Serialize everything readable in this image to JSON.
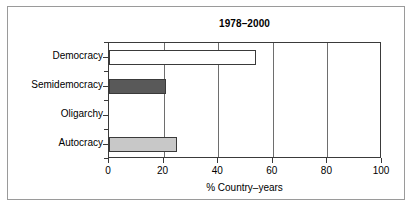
{
  "chart_data": {
    "type": "bar",
    "orientation": "horizontal",
    "title": "1978–2000",
    "xlabel": "% Country–years",
    "ylabel": "",
    "xlim": [
      0,
      100
    ],
    "xticks": [
      0,
      20,
      40,
      60,
      80,
      100
    ],
    "xtick_labels": [
      "0",
      "20",
      "40",
      "60",
      "80",
      "100"
    ],
    "grid": "vertical",
    "legend": "none",
    "categories": [
      "Democracy",
      "Semidemocracy",
      "Oligarchy",
      "Autocracy"
    ],
    "values": [
      54,
      21,
      0,
      25
    ],
    "bar_colors": [
      "#ffffff",
      "#595959",
      "#ffffff",
      "#c8c8c8"
    ],
    "bar_edge_color": "#3a3a3a",
    "bars": [
      {
        "category": "Democracy",
        "value": 54,
        "fill": "#ffffff"
      },
      {
        "category": "Semidemocracy",
        "value": 21,
        "fill": "#595959"
      },
      {
        "category": "Oligarchy",
        "value": 0,
        "fill": "#ffffff"
      },
      {
        "category": "Autocracy",
        "value": 25,
        "fill": "#c8c8c8"
      }
    ]
  },
  "figure": {
    "background": "#ffffff",
    "frame_color": "#9a9a9a",
    "axis_color": "#3a3a3a",
    "gridline_color": "#6e6e6e"
  }
}
